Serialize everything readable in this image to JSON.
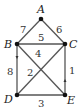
{
  "diagram": {
    "type": "weighted-graph",
    "nodes": [
      {
        "id": "A",
        "label": "A",
        "x": 41,
        "y": 19
      },
      {
        "id": "B",
        "label": "B",
        "x": 17,
        "y": 44
      },
      {
        "id": "C",
        "label": "C",
        "x": 65,
        "y": 44
      },
      {
        "id": "D",
        "label": "D",
        "x": 17,
        "y": 95
      },
      {
        "id": "E",
        "label": "E",
        "x": 65,
        "y": 95
      }
    ],
    "edges": [
      {
        "from": "A",
        "to": "B",
        "weight": "7"
      },
      {
        "from": "A",
        "to": "C",
        "weight": "6"
      },
      {
        "from": "B",
        "to": "C",
        "weight": "5"
      },
      {
        "from": "B",
        "to": "E",
        "weight": "4"
      },
      {
        "from": "C",
        "to": "D",
        "weight": "2"
      },
      {
        "from": "B",
        "to": "D",
        "weight": "8"
      },
      {
        "from": "C",
        "to": "E",
        "weight": "1"
      },
      {
        "from": "D",
        "to": "E",
        "weight": "3"
      }
    ]
  }
}
